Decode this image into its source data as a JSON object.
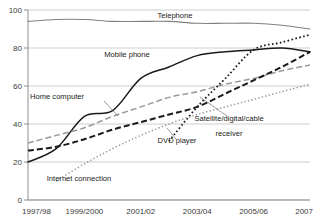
{
  "chart_data": {
    "type": "line",
    "title": "",
    "xlabel": "",
    "ylabel": "",
    "ylim": [
      0,
      100
    ],
    "yticks": [
      0,
      20,
      40,
      60,
      80,
      100
    ],
    "grid": true,
    "legend_position": "inline-labels",
    "categories": [
      "1997/98",
      "1998/99",
      "1999/2000",
      "2000/01",
      "2001/02",
      "2002/03",
      "2003/04",
      "2004/05",
      "2005/06",
      "2006/07",
      "2007"
    ],
    "x_tick_labels": [
      "1997/98",
      "1999/2000",
      "2001/02",
      "2003/04",
      "2005/06",
      "2007"
    ],
    "series": [
      {
        "name": "Telephone",
        "style": "solid-grey",
        "color": "#808080",
        "values": [
          94,
          95,
          95,
          94,
          94,
          94,
          93,
          93,
          93,
          92,
          90
        ]
      },
      {
        "name": "Mobile phone",
        "style": "solid-black",
        "color": "#1a1a1a",
        "values": [
          20,
          27,
          44,
          47,
          64,
          70,
          76,
          78,
          79,
          80,
          78
        ]
      },
      {
        "name": "Home computer",
        "style": "dashed-grey",
        "color": "#9a9a9a",
        "values": [
          30,
          34,
          38,
          44,
          49,
          54,
          57,
          61,
          64,
          68,
          71
        ]
      },
      {
        "name": "Satellite/digital/cable receiver",
        "style": "dashed-black",
        "color": "#1a1a1a",
        "values": [
          26,
          28,
          32,
          37,
          41,
          45,
          49,
          56,
          63,
          70,
          78
        ]
      },
      {
        "name": "DVD player",
        "style": "dotted-black",
        "color": "#1a1a1a",
        "values": [
          null,
          null,
          null,
          null,
          null,
          31,
          49,
          64,
          79,
          83,
          87
        ]
      },
      {
        "name": "Internet connection",
        "style": "dotted-grey",
        "color": "#9a9a9a",
        "values": [
          null,
          10,
          19,
          27,
          34,
          40,
          45,
          49,
          53,
          57,
          61
        ]
      }
    ],
    "annotations": [
      {
        "text": "Telephone",
        "x": 175,
        "y": 18
      },
      {
        "text": "Mobile phone",
        "x": 127,
        "y": 57
      },
      {
        "text": "Home computer",
        "x": 57,
        "y": 99
      },
      {
        "text": "DVD player",
        "x": 177,
        "y": 143
      },
      {
        "text": "Satellite/digital/cable",
        "x": 229,
        "y": 121
      },
      {
        "text": "receiver",
        "x": 229,
        "y": 136
      },
      {
        "text": "Internet connection",
        "x": 79,
        "y": 181
      }
    ]
  }
}
